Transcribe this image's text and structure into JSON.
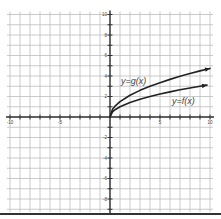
{
  "chart_data": {
    "type": "line",
    "title": "",
    "xlabel": "",
    "ylabel": "",
    "xlim": [
      -10,
      10
    ],
    "ylim": [
      -9,
      10
    ],
    "grid": true,
    "x_tick_labels": [
      "-10",
      "-5",
      "5",
      "10"
    ],
    "y_tick_labels": [
      "10",
      "8",
      "6",
      "4",
      "2",
      "-2",
      "-4",
      "-6",
      "-8"
    ],
    "series": [
      {
        "name": "y=g(x)",
        "x": [
          0,
          0.25,
          0.5,
          1,
          2,
          3,
          4,
          5,
          6,
          7,
          8,
          9,
          10
        ],
        "values": [
          0,
          0.75,
          1.06,
          1.5,
          2.12,
          2.6,
          3.0,
          3.35,
          3.67,
          3.97,
          4.24,
          4.5,
          4.74
        ],
        "arrow_end": true
      },
      {
        "name": "y=f(x)",
        "x": [
          0,
          0.25,
          0.5,
          1,
          2,
          3,
          4,
          5,
          6,
          7,
          8,
          9,
          9.7
        ],
        "values": [
          0,
          0.5,
          0.71,
          1,
          1.41,
          1.73,
          2,
          2.24,
          2.45,
          2.65,
          2.83,
          3,
          3.11
        ],
        "arrow_end": true
      }
    ],
    "annotations": [
      {
        "text": "y=g(x)",
        "x": 2.5,
        "y": 3.5
      },
      {
        "text": "y=f(x)",
        "x": 6.5,
        "y": 1.5
      }
    ]
  },
  "labels": {
    "g": "y=g(x)",
    "f": "y=f(x)"
  },
  "colors": {
    "grid": "#bdbdbd",
    "axis": "#333333",
    "curve": "#222222",
    "text": "#444444"
  }
}
